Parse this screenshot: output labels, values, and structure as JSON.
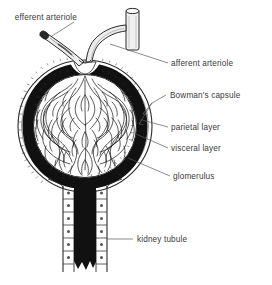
{
  "figure": {
    "background_color": "#ffffff",
    "ink_color": "#1a1a1a",
    "label_color": "#3a3a3a",
    "leader_color": "#5a5a5a",
    "style": "black and white scientific line drawing"
  },
  "labels": {
    "efferent_arteriole": "efferent arteriole",
    "afferent_arteriole": "afferent arteriole",
    "bowmans_capsule": "Bowman's capsule",
    "parietal_layer": "parietal layer",
    "visceral_layer": "visceral layer",
    "glomerulus": "glomerulus",
    "kidney_tubule": "kidney tubule"
  },
  "structures": {
    "capsule_space": "Bowman's space filled solid black",
    "capillary_tuft": "tangle of glomerular capillary loops",
    "tubule_cells": "cuboidal epithelial cells with nuclei lining tubule",
    "vessel_stub": "cut arteriole stub at top right"
  }
}
